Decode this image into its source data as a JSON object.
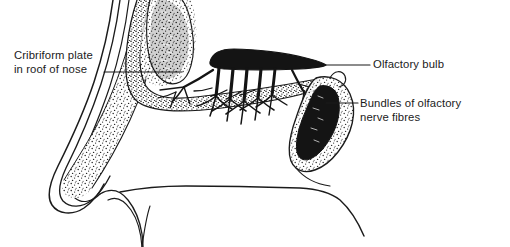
{
  "figure": {
    "background_color": "#ffffff",
    "ink_color": "#1b1b1b",
    "width": 510,
    "height": 247
  },
  "labels": {
    "cribriform_plate": "Cribriform plate\nin roof of nose",
    "olfactory_bulb": "Olfactory bulb",
    "nerve_bundles": "Bundles of olfactory\nnerve fibres"
  },
  "structures": {
    "olfactory_bulb": "olfactory-bulb",
    "nerve_fibre_bundles": "olfactory-nerve-fibre-bundles",
    "superior_turbinate": "superior-turbinate",
    "inferior_turbinate": "inferior-turbinate",
    "cribriform_plate": "cribriform-plate",
    "nasal_septum_profile": "nasal-profile",
    "hard_palate": "hard-palate",
    "tongue_outline": "tongue-outline"
  },
  "leader_lines": {
    "cribriform_plate": "leader-line-cribriform-plate",
    "olfactory_bulb": "leader-line-olfactory-bulb",
    "nerve_bundles": "leader-line-nerve-bundles"
  }
}
